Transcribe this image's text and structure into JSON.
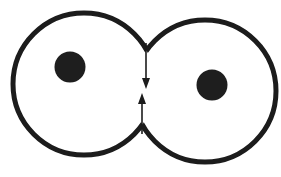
{
  "diagram": {
    "title": "",
    "colors": {
      "background": "#ffffff",
      "outline": "#1c1c1c",
      "nucleus": "#1e1e1e"
    },
    "cells": [
      {
        "id": "left-cell",
        "cx": 84,
        "cy": 84,
        "r": 71,
        "nucleus": {
          "cx": 70,
          "cy": 67,
          "r": 15.5
        }
      },
      {
        "id": "right-cell",
        "cx": 205,
        "cy": 91,
        "r": 71,
        "nucleus": {
          "cx": 212,
          "cy": 85,
          "r": 15.5
        }
      }
    ],
    "furrow": {
      "top_notch": {
        "x": 146,
        "y": 43
      },
      "bottom_notch": {
        "x": 142,
        "y": 134
      }
    },
    "arrows": [
      {
        "id": "arrow-down",
        "direction": "down",
        "from": {
          "x": 146,
          "y": 43
        },
        "to": {
          "x": 146,
          "y": 89
        }
      },
      {
        "id": "arrow-up",
        "direction": "up",
        "from": {
          "x": 142,
          "y": 134
        },
        "to": {
          "x": 142,
          "y": 93
        }
      }
    ]
  }
}
